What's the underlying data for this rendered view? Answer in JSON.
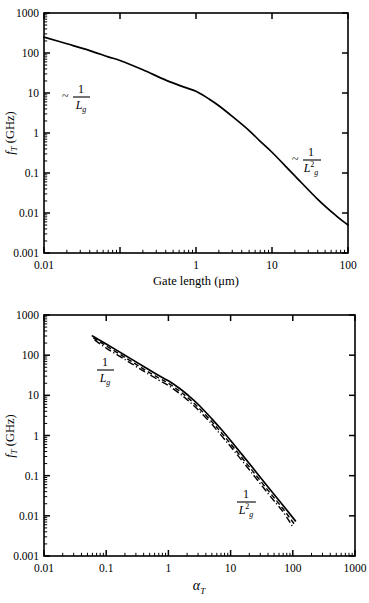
{
  "figure": {
    "panels": [
      {
        "id": "top",
        "ylabel": "f",
        "ylabel_sub": "T",
        "ylabel_unit": " (GHz)",
        "xlabel": "Gate length (μm)",
        "ytick_labels": [
          "1000",
          "100",
          "10",
          "1",
          "0.1",
          "0.01",
          "0.001"
        ],
        "xtick_labels": [
          "0.01",
          "1",
          "10",
          "100"
        ],
        "annotations": [
          {
            "name": "tilde-one-over-lg",
            "tilde": "~",
            "numerator": "1",
            "denominator": "L",
            "den_sub": "g",
            "den_exp": ""
          },
          {
            "name": "tilde-one-over-lg-squared",
            "tilde": "~",
            "numerator": "1",
            "denominator": "L",
            "den_sub": "g",
            "den_exp": "2"
          }
        ]
      },
      {
        "id": "bottom",
        "ylabel": "f",
        "ylabel_sub": "T",
        "ylabel_unit": " (GHz)",
        "xlabel": "α",
        "xlabel_sub": "T",
        "ytick_labels": [
          "1000",
          "100",
          "10",
          "1",
          "0.1",
          "0.01",
          "0.001"
        ],
        "xtick_labels": [
          "0.01",
          "0.1",
          "1",
          "10",
          "100",
          "1000"
        ],
        "annotations": [
          {
            "name": "one-over-lg",
            "tilde": "",
            "numerator": "1",
            "denominator": "L",
            "den_sub": "g",
            "den_exp": ""
          },
          {
            "name": "one-over-lg-squared",
            "tilde": "",
            "numerator": "1",
            "denominator": "L",
            "den_sub": "g",
            "den_exp": "2"
          }
        ]
      }
    ]
  },
  "chart_data": [
    {
      "type": "line",
      "panel": "top",
      "title": "",
      "xlabel": "Gate length (μm)",
      "ylabel": "f_T (GHz)",
      "xscale": "log",
      "yscale": "log",
      "xlim": [
        0.01,
        100
      ],
      "ylim": [
        0.001,
        1000
      ],
      "xticks": [
        0.01,
        0.1,
        1,
        10,
        100
      ],
      "xtick_labels": [
        "0.01",
        "",
        "1",
        "10",
        "100"
      ],
      "yticks": [
        0.001,
        0.01,
        0.1,
        1,
        10,
        100,
        1000
      ],
      "ytick_labels": [
        "0.001",
        "0.01",
        "0.1",
        "1",
        "10",
        "100",
        "1000"
      ],
      "grid": false,
      "legend": "none",
      "annotations": [
        {
          "text": "~ 1/L_g",
          "x": 0.06,
          "y": 9
        },
        {
          "text": "~ 1/L_g^2",
          "x": 22,
          "y": 0.25
        }
      ],
      "series": [
        {
          "name": "fT vs gate length",
          "style": "solid",
          "x": [
            0.01,
            0.02,
            0.04,
            0.07,
            0.1,
            0.2,
            0.4,
            0.7,
            1.0,
            1.5,
            2.0,
            3.0,
            5.0,
            7.0,
            10.0,
            20.0,
            40.0,
            70.0,
            100.0
          ],
          "values": [
            250,
            170,
            115,
            80,
            65,
            38,
            21,
            14,
            11,
            7.0,
            4.8,
            2.6,
            1.15,
            0.62,
            0.33,
            0.085,
            0.022,
            0.0085,
            0.005
          ]
        }
      ]
    },
    {
      "type": "line",
      "panel": "bottom",
      "title": "",
      "xlabel": "α_T",
      "ylabel": "f_T (GHz)",
      "xscale": "log",
      "yscale": "log",
      "xlim": [
        0.01,
        1000
      ],
      "ylim": [
        0.001,
        1000
      ],
      "xticks": [
        0.01,
        0.1,
        1,
        10,
        100,
        1000
      ],
      "xtick_labels": [
        "0.01",
        "0.1",
        "1",
        "10",
        "100",
        "1000"
      ],
      "yticks": [
        0.001,
        0.01,
        0.1,
        1,
        10,
        100,
        1000
      ],
      "ytick_labels": [
        "0.001",
        "0.01",
        "0.1",
        "1",
        "10",
        "100",
        "1000"
      ],
      "grid": false,
      "legend": "none",
      "annotations": [
        {
          "text": "1/L_g",
          "x": 0.14,
          "y": 45
        },
        {
          "text": "1/L_g^2",
          "x": 28,
          "y": 0.032
        }
      ],
      "series": [
        {
          "name": "upper curve",
          "style": "solid",
          "x": [
            0.06,
            0.1,
            0.2,
            0.4,
            0.7,
            1.0,
            1.5,
            2.0,
            3.0,
            5.0,
            7.0,
            10.0,
            20.0,
            40.0,
            70.0,
            110.0
          ],
          "values": [
            300,
            190,
            100,
            52,
            31,
            23,
            15,
            10.5,
            6.0,
            2.6,
            1.45,
            0.75,
            0.2,
            0.052,
            0.018,
            0.0075
          ]
        },
        {
          "name": "middle curve",
          "style": "dashed",
          "x": [
            0.062,
            0.1,
            0.2,
            0.4,
            0.7,
            1.0,
            1.5,
            2.0,
            3.0,
            5.0,
            7.0,
            10.0,
            20.0,
            40.0,
            70.0,
            105.0
          ],
          "values": [
            270,
            170,
            88,
            45,
            27,
            20,
            12.8,
            9.0,
            5.1,
            2.2,
            1.2,
            0.62,
            0.165,
            0.043,
            0.0148,
            0.0063
          ]
        },
        {
          "name": "lower curve",
          "style": "dashdot",
          "x": [
            0.065,
            0.1,
            0.2,
            0.4,
            0.7,
            1.0,
            1.5,
            2.0,
            3.0,
            5.0,
            7.0,
            10.0,
            20.0,
            40.0,
            70.0,
            100.0
          ],
          "values": [
            240,
            150,
            78,
            40,
            24,
            17.5,
            11.2,
            7.8,
            4.4,
            1.9,
            1.02,
            0.53,
            0.14,
            0.036,
            0.0124,
            0.0053
          ]
        }
      ]
    }
  ]
}
